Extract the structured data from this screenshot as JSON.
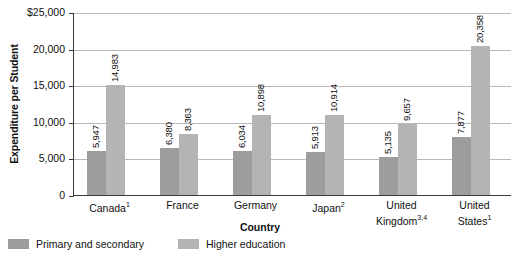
{
  "chart_data": {
    "type": "bar",
    "title": "",
    "xlabel": "Country",
    "ylabel": "Expenditure per Student",
    "categories": [
      {
        "label": "Canada",
        "footnote": "1"
      },
      {
        "label": "France",
        "footnote": ""
      },
      {
        "label": "Germany",
        "footnote": ""
      },
      {
        "label": "Japan",
        "footnote": "2"
      },
      {
        "label": "United Kingdom",
        "footnote": "3,4"
      },
      {
        "label": "United States",
        "footnote": "1"
      }
    ],
    "series": [
      {
        "name": "Primary and secondary",
        "color": "#9d9d9d",
        "values": [
          5947,
          6380,
          6034,
          5913,
          5135,
          7877
        ],
        "value_labels": [
          "5,947",
          "6,380",
          "6,034",
          "5,913",
          "5,135",
          "7,877"
        ]
      },
      {
        "name": "Higher education",
        "color": "#b4b4b4",
        "values": [
          14983,
          8363,
          10898,
          10914,
          9657,
          20358
        ],
        "value_labels": [
          "14,983",
          "8,363",
          "10,898",
          "10,914",
          "9,657",
          "20,358"
        ]
      }
    ],
    "ylim": [
      0,
      25000
    ],
    "yticks": [
      0,
      5000,
      10000,
      15000,
      20000,
      25000
    ],
    "ytick_labels": [
      "0",
      "5,000",
      "10,000",
      "15,000",
      "20,000",
      "$25,000"
    ],
    "grid": true,
    "legend_position": "bottom-left"
  }
}
